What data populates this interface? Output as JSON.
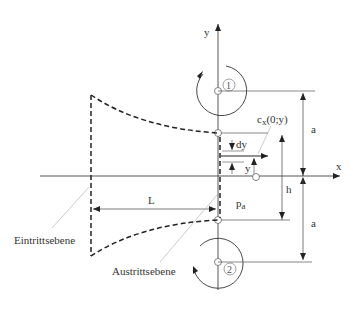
{
  "diagram": {
    "axes": {
      "x_label": "x",
      "y_label": "y"
    },
    "vortices": [
      {
        "id": "1",
        "label": "①",
        "rotation": "counterclockwise"
      },
      {
        "id": "2",
        "label": "②",
        "rotation": "counterclockwise"
      }
    ],
    "dimensions": {
      "a_upper": "a",
      "a_lower": "a",
      "h": "h",
      "L": "L",
      "dy": "dy",
      "y": "y"
    },
    "labels": {
      "velocity": "c",
      "velocity_sub": "x",
      "velocity_args": "(0;y)",
      "pressure": "p",
      "pressure_sub": "a",
      "inlet_plane": "Eintrittsebene",
      "outlet_plane": "Austrittsebene"
    },
    "colors": {
      "line": "#222222",
      "thin": "#555555",
      "leader": "#aaaaaa"
    }
  }
}
